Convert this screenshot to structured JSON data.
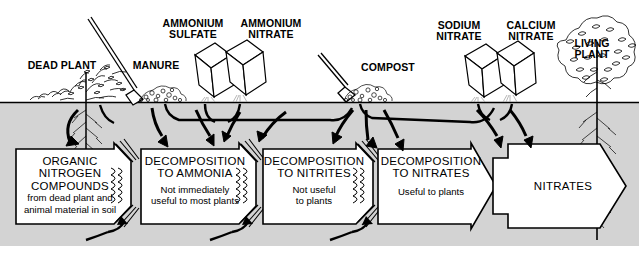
{
  "diagram": {
    "colors": {
      "soil": "#d3d3d3",
      "sky": "#ffffff",
      "ink": "#000000",
      "box_fill": "#ffffff"
    },
    "ground_line_y": 102
  },
  "above_ground_labels": [
    {
      "id": "dead-plant",
      "text": "DEAD PLANT",
      "x": 24,
      "y": 60,
      "w": 76
    },
    {
      "id": "manure",
      "text": "MANURE",
      "x": 128,
      "y": 60,
      "w": 56
    },
    {
      "id": "ammonium-sulfate",
      "text": "AMMONIUM\nSULFATE",
      "x": 155,
      "y": 18,
      "w": 76
    },
    {
      "id": "ammonium-nitrate",
      "text": "AMMONIUM\nNITRATE",
      "x": 233,
      "y": 18,
      "w": 76
    },
    {
      "id": "compost",
      "text": "COMPOST",
      "x": 357,
      "y": 62,
      "w": 62
    },
    {
      "id": "sodium-nitrate",
      "text": "SODIUM\nNITRATE",
      "x": 426,
      "y": 20,
      "w": 66
    },
    {
      "id": "calcium-nitrate",
      "text": "CALCIUM\nNITRATE",
      "x": 498,
      "y": 20,
      "w": 66
    },
    {
      "id": "living-plant",
      "text": "LIVING\nPLANT",
      "x": 562,
      "y": 38,
      "w": 60
    }
  ],
  "process_boxes": [
    {
      "id": "organic-nitrogen-compounds",
      "title": "ORGANIC\nNITROGEN\nCOMPOUNDS",
      "subtitle": "from dead plant and\nanimal material in soil",
      "x": 16,
      "y": 149,
      "w": 110,
      "h": 75
    },
    {
      "id": "decomposition-to-ammonia",
      "title": "DECOMPOSITION\nTO AMMONIA",
      "subtitle": "Not immediately\nuseful to most plants",
      "x": 141,
      "y": 149,
      "w": 114,
      "h": 75
    },
    {
      "id": "decomposition-to-nitrites",
      "title": "DECOMPOSITION\nTO NITRITES",
      "subtitle": "Not useful\nto plants",
      "x": 263,
      "y": 149,
      "w": 110,
      "h": 75
    },
    {
      "id": "decomposition-to-nitrates",
      "title": "DECOMPOSITION\nTO NITRATES",
      "subtitle": "Useful to plants",
      "x": 378,
      "y": 149,
      "w": 110,
      "h": 75
    },
    {
      "id": "nitrates",
      "title": "NITRATES",
      "subtitle": "",
      "x": 493,
      "y": 142,
      "w": 130,
      "h": 88
    }
  ],
  "box_title_parts": {
    "b1": {
      "l1": "ORGANIC",
      "l2": "NITROGEN",
      "l3": "COMPOUNDS",
      "s1": "from dead plant and",
      "s2": "animal material in soil"
    },
    "b2": {
      "l1": "DECOMPOSITION",
      "l2": "TO AMMONIA",
      "s1": "Not immediately",
      "s2": "useful to most plants"
    },
    "b3": {
      "l1": "DECOMPOSITION",
      "l2": "TO NITRITES",
      "s1": "Not useful",
      "s2": "to plants"
    },
    "b4": {
      "l1": "DECOMPOSITION",
      "l2": "TO NITRATES",
      "s1": "Useful to plants",
      "s2": ""
    },
    "b5": {
      "l1": "NITRATES"
    }
  },
  "scene_objects": [
    {
      "id": "dead-plant-drawing",
      "type": "plant-with-roots"
    },
    {
      "id": "shovel-drawing",
      "type": "shovel"
    },
    {
      "id": "manure-pile-drawing",
      "type": "pile"
    },
    {
      "id": "ammonium-sulfate-bag",
      "type": "pouring-bag"
    },
    {
      "id": "ammonium-nitrate-bag",
      "type": "pouring-bag"
    },
    {
      "id": "compost-pile-drawing",
      "type": "pile"
    },
    {
      "id": "sodium-nitrate-bag",
      "type": "pouring-bag"
    },
    {
      "id": "calcium-nitrate-bag",
      "type": "pouring-bag"
    },
    {
      "id": "living-plant-drawing",
      "type": "tree-with-roots"
    }
  ]
}
